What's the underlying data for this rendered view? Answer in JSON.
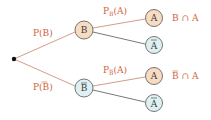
{
  "diagram": {
    "type": "probability-tree",
    "colors": {
      "label": "#d0643a",
      "line_top": "#c9836a",
      "line_inner": "#555555",
      "node_outline": "#555555",
      "node_fill_event": "#f7dcc3",
      "node_fill_complement": "#dff0f3",
      "root": "#111111"
    },
    "root": {
      "x": 14,
      "y": 59
    },
    "level1": [
      {
        "id": "B",
        "text": "B",
        "bar": false,
        "x": 84,
        "y": 30,
        "fill": "event",
        "edge_label": "P(B)",
        "edge_label_bar": false
      },
      {
        "id": "Bbar",
        "text": "B",
        "bar": true,
        "x": 84,
        "y": 88,
        "fill": "complement",
        "edge_label": "P(B)",
        "edge_label_bar": true
      }
    ],
    "level2": [
      {
        "parent": "B",
        "text": "A",
        "bar": false,
        "x": 154,
        "y": 18,
        "fill": "event",
        "edge_label_main": "P",
        "edge_label_sub": "B",
        "edge_label_sub_bar": false,
        "edge_label_arg": "(A)",
        "result": "B ∩ A",
        "result_bar": false
      },
      {
        "parent": "B",
        "text": "A",
        "bar": true,
        "x": 154,
        "y": 45,
        "fill": "complement"
      },
      {
        "parent": "Bbar",
        "text": "A",
        "bar": false,
        "x": 154,
        "y": 76,
        "fill": "event",
        "edge_label_main": "P",
        "edge_label_sub": "B",
        "edge_label_sub_bar": true,
        "edge_label_arg": "(A)",
        "result": "B ∩ A",
        "result_bar": true
      },
      {
        "parent": "Bbar",
        "text": "A",
        "bar": true,
        "x": 154,
        "y": 103,
        "fill": "complement"
      }
    ],
    "labels": {
      "p_b": "P(B)",
      "p_bbar_pre": "P(",
      "p_bbar_mid": "B",
      "p_bbar_post": ")",
      "pb_a_P": "P",
      "pb_a_sub": "B",
      "pb_a_arg": "(A)",
      "pbbar_a_P": "P",
      "pbbar_a_sub": "B",
      "pbbar_a_arg": "(A)",
      "node_B": "B",
      "node_Bbar": "B",
      "node_A1": "A",
      "node_Abar1": "A",
      "node_A2": "A",
      "node_Abar2": "A",
      "res1": "B ∩ A",
      "res2_B": "B",
      "res2_rest": " ∩ A"
    }
  }
}
